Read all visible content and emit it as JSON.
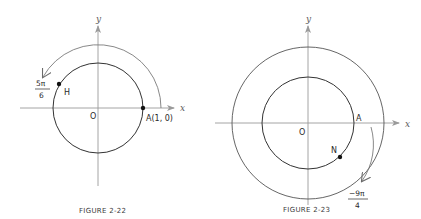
{
  "figures": [
    {
      "caption": "FIGURE 2-22",
      "axis_x_label": "x",
      "axis_y_label": "y",
      "origin_label": "O",
      "point_a_label": "A(1, 0)",
      "point_h_label": "H",
      "angle_numerator": "5π",
      "angle_denominator": "6",
      "description": "Unit circle with counter-clockwise arc from A(1,0) to H at angle 5π/6"
    },
    {
      "caption": "FIGURE 2-23",
      "axis_x_label": "x",
      "axis_y_label": "y",
      "origin_label": "O",
      "point_a_label": "A",
      "point_n_label": "N",
      "angle_numerator": "−9π",
      "angle_denominator": "4",
      "description": "Unit circle with clockwise spiral arc from A to N at angle −9π/4"
    }
  ],
  "colors": {
    "axis": "#9a9a9a",
    "circle": "#333333",
    "arc": "#7a7a7a",
    "point": "#111111"
  }
}
